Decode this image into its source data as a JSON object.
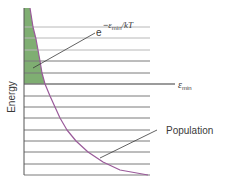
{
  "diagram": {
    "axis_label": "Energy",
    "boltzmann_label": {
      "base": "e",
      "exponent_prefix": "−",
      "exponent_symbol": "ε",
      "exponent_sub": "min",
      "exponent_suffix": "/kT"
    },
    "emin_label": {
      "symbol": "ε",
      "sub": "min"
    },
    "population_label": "Population",
    "colors": {
      "levels": "#7a7a7a",
      "levels_light": "#b8b8b8",
      "curve": "#9a5a9a",
      "fill": "#7fae72",
      "leader": "#3a3a3a",
      "axis": "#555555"
    }
  },
  "chart_data": {
    "type": "diagram",
    "title": "",
    "ylabel": "Energy",
    "annotations": [
      "e^(−ε_min/kT)",
      "ε_min",
      "Population"
    ],
    "axis": {
      "x": 24,
      "y_top": 8,
      "y_bottom": 175
    },
    "levels_y": [
      27,
      38,
      50,
      61,
      73,
      84,
      96,
      107,
      118,
      130,
      141,
      152,
      164,
      175
    ],
    "emin_level_index": 5,
    "levels_x_end": 150,
    "emin_x_end": 175,
    "curve_points": [
      [
        30,
        8
      ],
      [
        33,
        27
      ],
      [
        36,
        39
      ],
      [
        38,
        50
      ],
      [
        40,
        61
      ],
      [
        42,
        73
      ],
      [
        45,
        84
      ],
      [
        50,
        96
      ],
      [
        55,
        107
      ],
      [
        60,
        118
      ],
      [
        67,
        130
      ],
      [
        76,
        141
      ],
      [
        88,
        152
      ],
      [
        103,
        162
      ],
      [
        120,
        170
      ],
      [
        148,
        175
      ]
    ],
    "shaded_region": "area between axis and curve above ε_min",
    "leaders": {
      "boltzmann": [
        [
          33,
          68
        ],
        [
          95,
          33
        ]
      ],
      "population": [
        [
          100,
          158
        ],
        [
          157,
          130
        ]
      ]
    }
  }
}
